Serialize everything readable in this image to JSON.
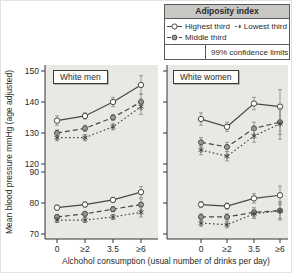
{
  "colors": {
    "line": "#474747",
    "error_bar": "#8f8f8f",
    "panel_bg": "#e9e8e4",
    "legend_header_bg": "#c9c8c5",
    "text": "#2b2b2b"
  },
  "chart_data": {
    "type": "line",
    "x_categories": [
      "0",
      "≥2",
      "3.5",
      "≥6"
    ],
    "y_ticks": [
      150,
      140,
      130,
      120,
      90,
      80,
      70
    ],
    "ylabel": "Mean blood pressure mmHg (age adjusted)",
    "xlabel": "Alchohol consumption (usual number of drinks per day)",
    "y_axis_note": "broken axis: systolic section 120-150, diastolic section 70-90",
    "legend": {
      "title": "Adiposity index",
      "entries": [
        {
          "label": "Highest third",
          "marker": "open-circle",
          "line": "solid"
        },
        {
          "label": "Lowest third",
          "marker": "asterisk",
          "line": "dotted"
        },
        {
          "label": "Middle third",
          "marker": "filled-circle",
          "line": "dashed"
        }
      ],
      "note": "99% confidence limits"
    },
    "panels": [
      {
        "title": "White men",
        "series": [
          {
            "name": "Highest third",
            "marker": "open-circle",
            "line": "solid",
            "systolic": [
              134,
              135.5,
              140,
              145.5
            ],
            "systolic_ci": [
              1.5,
              1,
              1.5,
              3
            ],
            "diastolic": [
              78.5,
              79.5,
              81,
              83.5
            ],
            "diastolic_ci": [
              0.8,
              0.8,
              0.8,
              1.8
            ]
          },
          {
            "name": "Middle third",
            "marker": "filled-circle",
            "line": "dashed",
            "systolic": [
              130,
              131.5,
              135,
              140
            ],
            "systolic_ci": [
              1,
              1,
              1,
              2.5
            ],
            "diastolic": [
              75.5,
              76.5,
              78,
              79.5
            ],
            "diastolic_ci": [
              0.8,
              0.8,
              0.8,
              1.8
            ]
          },
          {
            "name": "Lowest third",
            "marker": "asterisk",
            "line": "dotted",
            "systolic": [
              128.5,
              128.5,
              132,
              138.5
            ],
            "systolic_ci": [
              1,
              1,
              1,
              2.5
            ],
            "diastolic": [
              74.5,
              74.5,
              75.5,
              77
            ],
            "diastolic_ci": [
              0.8,
              0.8,
              0.8,
              1.5
            ]
          }
        ]
      },
      {
        "title": "White women",
        "series": [
          {
            "name": "Highest third",
            "marker": "open-circle",
            "line": "solid",
            "systolic": [
              134.5,
              132,
              139.5,
              138.5
            ],
            "systolic_ci": [
              2,
              1.5,
              2,
              5.5
            ],
            "diastolic": [
              79.5,
              79,
              81.5,
              82.5
            ],
            "diastolic_ci": [
              1,
              1,
              1.5,
              3
            ]
          },
          {
            "name": "Middle third",
            "marker": "filled-circle",
            "line": "dashed",
            "systolic": [
              127,
              125.5,
              131.5,
              133.5
            ],
            "systolic_ci": [
              1.5,
              1.5,
              2,
              4
            ],
            "diastolic": [
              75.5,
              75.5,
              77,
              77.5
            ],
            "diastolic_ci": [
              1,
              1,
              1.5,
              2.5
            ]
          },
          {
            "name": "Lowest third",
            "marker": "asterisk",
            "line": "dotted",
            "systolic": [
              124.5,
              122.5,
              129,
              133
            ],
            "systolic_ci": [
              1.5,
              1.5,
              2,
              5
            ],
            "diastolic": [
              73.5,
              73,
              76.5,
              77.5
            ],
            "diastolic_ci": [
              1,
              1,
              1.5,
              3
            ]
          }
        ]
      }
    ]
  }
}
